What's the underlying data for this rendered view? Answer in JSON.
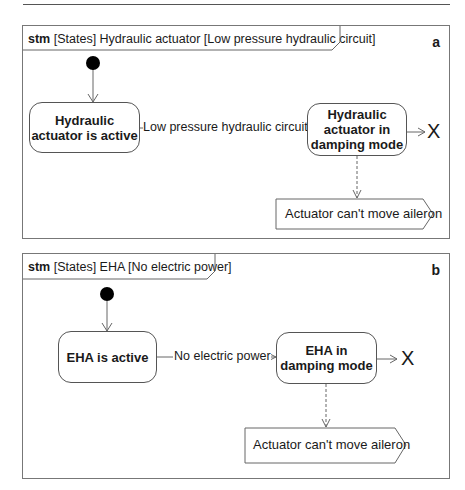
{
  "diagram_a": {
    "keyword": "stm",
    "title": "[States] Hydraulic actuator [Low pressure hydraulic circuit]",
    "corner_label": "a",
    "initial_state": "initial-node",
    "state_1": "Hydraulic actuator is active",
    "transition_label": "Low pressure hydraulic circuit",
    "state_2": "Hydraulic actuator in damping mode",
    "terminate": "X",
    "signal": "Actuator can't move aileron"
  },
  "diagram_b": {
    "keyword": "stm",
    "title": "[States] EHA [No electric power]",
    "corner_label": "b",
    "initial_state": "initial-node",
    "state_1": "EHA is active",
    "transition_label": "No electric power",
    "state_2": "EHA in damping mode",
    "terminate": "X",
    "signal": "Actuator can't move aileron"
  }
}
